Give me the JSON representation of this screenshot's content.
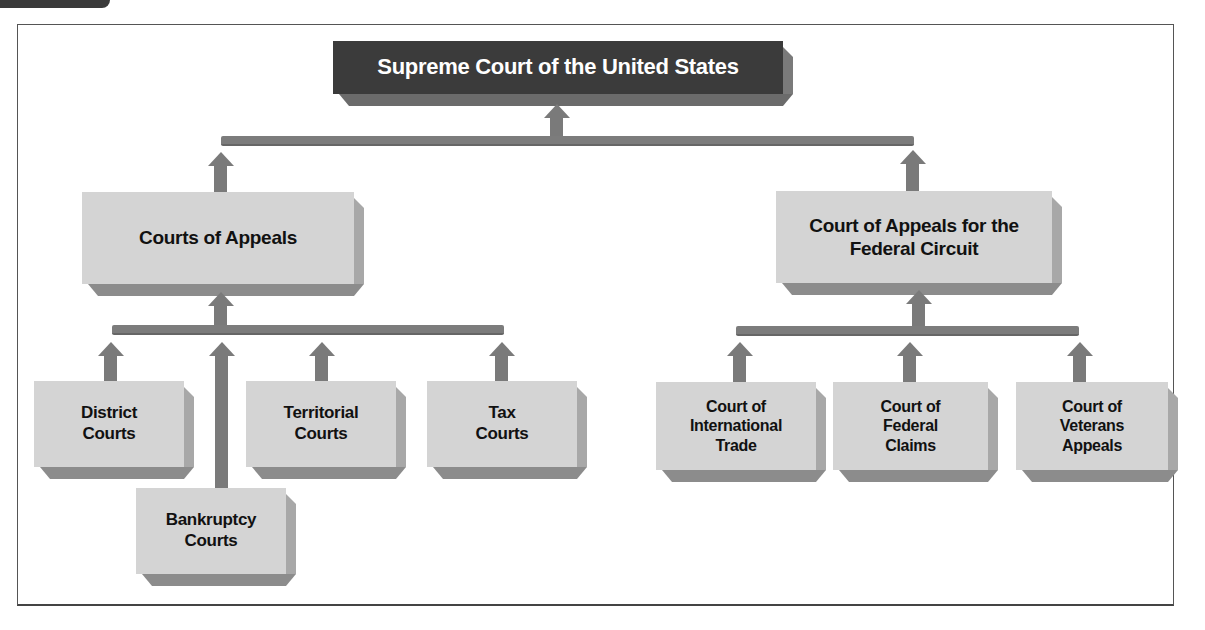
{
  "diagram": {
    "title": "Supreme Court of the United States",
    "level2": {
      "left": "Courts of Appeals",
      "right_line1": "Court of Appeals for the",
      "right_line2": "Federal Circuit"
    },
    "left_branch": {
      "district": {
        "line1": "District",
        "line2": "Courts"
      },
      "bankruptcy": {
        "line1": "Bankruptcy",
        "line2": "Courts"
      },
      "territorial": {
        "line1": "Territorial",
        "line2": "Courts"
      },
      "tax": {
        "line1": "Tax",
        "line2": "Courts"
      }
    },
    "right_branch": {
      "international_trade": {
        "line1": "Court of",
        "line2": "International",
        "line3": "Trade"
      },
      "federal_claims": {
        "line1": "Court of",
        "line2": "Federal",
        "line3": "Claims"
      },
      "veterans_appeals": {
        "line1": "Court of",
        "line2": "Veterans",
        "line3": "Appeals"
      }
    },
    "colors": {
      "top_box": "#3b3b3b",
      "boxes": "#d4d4d4",
      "connectors": "#7a7a7a"
    }
  }
}
